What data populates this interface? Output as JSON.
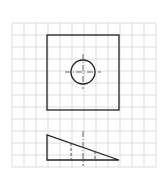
{
  "diagram": {
    "title": "",
    "type": "orthographic-projection-on-grid",
    "colors": {
      "background": "#ffffff",
      "grid": "#d4d4d4",
      "stroke": "#222222"
    },
    "grid": {
      "x0": 12,
      "y0": 23,
      "cell": 12,
      "cols": 12,
      "rows": 12
    },
    "top_view": {
      "square": {
        "x": 47,
        "y": 35,
        "w": 72,
        "h": 75
      },
      "hole": {
        "cx": 83,
        "cy": 72,
        "r": 12
      },
      "centerline_h": {
        "x1": 65,
        "x2": 101,
        "y": 72
      },
      "centerline_v": {
        "x": 83,
        "y1": 54,
        "y2": 89
      }
    },
    "front_view": {
      "triangle": [
        [
          47,
          135
        ],
        [
          47,
          160
        ],
        [
          119,
          160
        ]
      ],
      "hidden_lines": [
        {
          "x": 71,
          "y1": 143,
          "y2": 160
        },
        {
          "x": 95,
          "y1": 151,
          "y2": 160
        }
      ],
      "centerline": {
        "x": 83,
        "y1": 131,
        "y2": 166
      }
    }
  }
}
